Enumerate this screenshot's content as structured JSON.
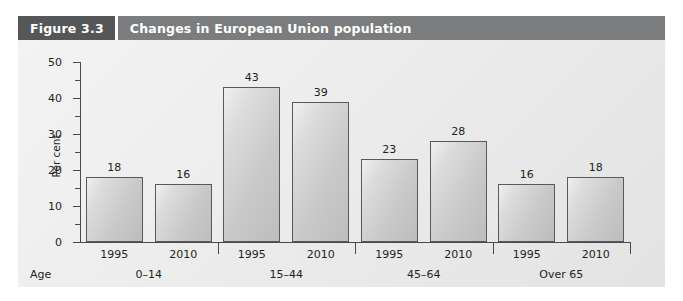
{
  "figure": {
    "number_label": "Figure 3.3",
    "title": "Changes in European Union population"
  },
  "colors": {
    "number_block": "#555658",
    "title_bar": "#7b7c7e",
    "panel_bg": "#ededed",
    "bar_fill": "#cccccc",
    "bar_outline": "#58595b",
    "text": "#231f20"
  },
  "chart_data": {
    "type": "bar",
    "title": "Changes in European Union population",
    "xlabel": "Age",
    "ylabel": "Per cent",
    "ylim": [
      0,
      50
    ],
    "yticks": [
      0,
      10,
      20,
      30,
      40,
      50
    ],
    "ytick_labels": [
      "0",
      "10",
      "20",
      "30",
      "40",
      "50"
    ],
    "yminor_ticks": [
      5,
      15,
      25,
      35,
      45
    ],
    "grid": false,
    "legend": null,
    "categories": [
      "1995",
      "2010",
      "1995",
      "2010",
      "1995",
      "2010",
      "1995",
      "2010"
    ],
    "values": [
      18,
      16,
      43,
      39,
      23,
      28,
      16,
      18
    ],
    "data_labels": [
      "18",
      "16",
      "43",
      "39",
      "23",
      "28",
      "16",
      "18"
    ],
    "groups": [
      {
        "label": "0–14",
        "categories": [
          "1995",
          "2010"
        ],
        "values": [
          18,
          16
        ]
      },
      {
        "label": "15–44",
        "categories": [
          "1995",
          "2010"
        ],
        "values": [
          43,
          39
        ]
      },
      {
        "label": "45–64",
        "categories": [
          "1995",
          "2010"
        ],
        "values": [
          23,
          28
        ]
      },
      {
        "label": "Over 65",
        "categories": [
          "1995",
          "2010"
        ],
        "values": [
          16,
          18
        ]
      }
    ],
    "group_labels": [
      "0–14",
      "15–44",
      "45–64",
      "Over 65"
    ],
    "axis_group_prefix": "Age"
  }
}
